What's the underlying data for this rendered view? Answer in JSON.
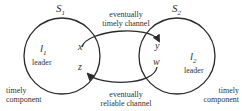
{
  "diagram": {
    "sets": [
      {
        "name": "S",
        "sub": "1"
      },
      {
        "name": "S",
        "sub": "2"
      }
    ],
    "leaders": [
      {
        "name": "l",
        "sub": "1",
        "label": "leader"
      },
      {
        "name": "l",
        "sub": "2",
        "label": "leader"
      }
    ],
    "processes": {
      "x": "x",
      "z": "z",
      "y": "y",
      "w": "w"
    },
    "channels": {
      "top": {
        "line1": "eventually",
        "line2": "timely channel"
      },
      "bottom": {
        "line1": "eventually",
        "line2": "reliable channel"
      }
    },
    "components": {
      "left": {
        "line1": "timely",
        "line2": "component"
      },
      "right": {
        "line1": "timely",
        "line2": "component"
      }
    },
    "colors": {
      "stroke": "#2a2a2a",
      "text": "#333333",
      "background": "#ffffff"
    }
  }
}
